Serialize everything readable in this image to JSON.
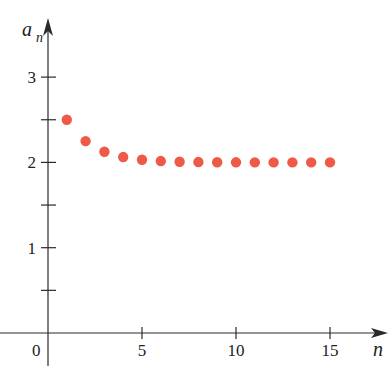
{
  "chart_data": {
    "type": "scatter",
    "title": "",
    "xlabel": "n",
    "ylabel": "a_n",
    "ylabel_main": "a",
    "ylabel_sub": "n",
    "xlim": [
      0,
      17.5
    ],
    "ylim": [
      0,
      3.5
    ],
    "grid": false,
    "legend": null,
    "origin_label": "0",
    "x_ticks": [
      {
        "value": 5,
        "label": "5"
      },
      {
        "value": 10,
        "label": "10"
      },
      {
        "value": 15,
        "label": "15"
      }
    ],
    "y_ticks": [
      {
        "value": 0.5,
        "label": ""
      },
      {
        "value": 1,
        "label": "1"
      },
      {
        "value": 1.5,
        "label": ""
      },
      {
        "value": 2,
        "label": "2"
      },
      {
        "value": 2.5,
        "label": ""
      },
      {
        "value": 3,
        "label": "3"
      }
    ],
    "series": [
      {
        "name": "a_n",
        "color": "#ee5a47",
        "x": [
          1,
          2,
          3,
          4,
          5,
          6,
          7,
          8,
          9,
          10,
          11,
          12,
          13,
          14,
          15
        ],
        "y": [
          2.5,
          2.25,
          2.125,
          2.0625,
          2.03125,
          2.015625,
          2.0078,
          2.0039,
          2.002,
          2.001,
          2.0005,
          2.0002,
          2.0001,
          2.0001,
          2.0
        ]
      }
    ]
  },
  "colors": {
    "axis": "#2a2a2a",
    "point": "#ee5a47",
    "background": "#ffffff"
  }
}
